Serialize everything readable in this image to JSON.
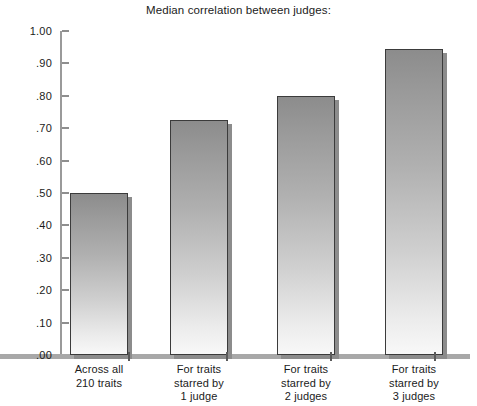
{
  "chart_data": {
    "type": "bar",
    "title": "Median correlation between judges:",
    "xlabel": "",
    "ylabel": "",
    "ylim": [
      0.0,
      1.0
    ],
    "grid": false,
    "legend": null,
    "categories": [
      "Across all 210 traits",
      "For traits starred by 1 judge",
      "For traits starred by 2 judges",
      "For traits starred by 3 judges"
    ],
    "category_label_lines": [
      [
        "Across all",
        "210 traits"
      ],
      [
        "For traits",
        "starred by",
        "1 judge"
      ],
      [
        "For traits",
        "starred by",
        "2 judges"
      ],
      [
        "For traits",
        "starred by",
        "3 judges"
      ]
    ],
    "values": [
      0.5,
      0.725,
      0.8,
      0.945
    ],
    "ytick_labels": [
      "1.00",
      ".90",
      ".80",
      ".70",
      ".60",
      ".50",
      ".40",
      ".30",
      ".20",
      ".10",
      ".00"
    ],
    "ytick_values": [
      1.0,
      0.9,
      0.8,
      0.7,
      0.6,
      0.5,
      0.4,
      0.3,
      0.2,
      0.1,
      0.0
    ],
    "colors": {
      "bar_top": "#8c8c8c",
      "bar_bottom": "#f8f8f8",
      "bar_border": "#3b3b3b",
      "bar_shadow": "#8c8c8c",
      "axis": "#9a9a9a",
      "baseline": "#a8a8a8",
      "text": "#1b1b1b",
      "background": "#ffffff"
    }
  }
}
